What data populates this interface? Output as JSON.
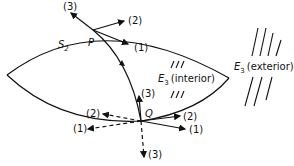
{
  "diagram": {
    "surface_label": "S",
    "surface_sub": "2",
    "point_p": "P",
    "point_q": "Q",
    "rays_p": {
      "r1": "(1)",
      "r2": "(2)",
      "r3": "(3)"
    },
    "rays_q": {
      "r1_solid": "(1)",
      "r2_solid": "(2)",
      "r3_solid": "(3)",
      "r1_dashed": "(1)",
      "r2_dashed": "(2)",
      "r3_dashed": "(3)"
    },
    "interior_region": {
      "symbol": "E",
      "sub": "3",
      "text": "(interior)"
    },
    "exterior_region": {
      "symbol": "E",
      "sub": "3",
      "text": "(exterior)"
    },
    "colors": {
      "ink": "#111111",
      "background": "#ffffff"
    }
  }
}
